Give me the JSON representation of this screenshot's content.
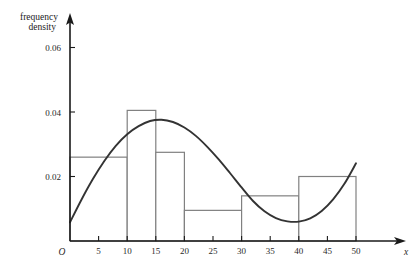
{
  "chart_data": {
    "type": "bar",
    "title": "",
    "subtitle": "",
    "ylabel_line1": "frequency",
    "ylabel_line2": "density",
    "xlabel": "x",
    "origin_label": "O",
    "grid": false,
    "legend": "none",
    "xlim": [
      0,
      52
    ],
    "ylim": [
      0,
      0.068
    ],
    "xticks": [
      5,
      10,
      15,
      20,
      25,
      30,
      35,
      40,
      45,
      50
    ],
    "xtick_labels": [
      "5",
      "10",
      "15",
      "20",
      "25",
      "30",
      "35",
      "40",
      "45",
      "50"
    ],
    "yticks": [
      0.02,
      0.04,
      0.06
    ],
    "ytick_labels": [
      "0.02",
      "0.04",
      "0.06"
    ],
    "bar_edges": [
      0,
      10,
      15,
      20,
      30,
      40,
      50
    ],
    "bars": [
      {
        "x_start": 0,
        "x_end": 10,
        "height": 0.026,
        "label": "0-10"
      },
      {
        "x_start": 10,
        "x_end": 15,
        "height": 0.0405,
        "label": "10-15"
      },
      {
        "x_start": 15,
        "x_end": 20,
        "height": 0.0275,
        "label": "15-20"
      },
      {
        "x_start": 20,
        "x_end": 30,
        "height": 0.0095,
        "label": "20-30"
      },
      {
        "x_start": 30,
        "x_end": 40,
        "height": 0.014,
        "label": "30-40"
      },
      {
        "x_start": 40,
        "x_end": 50,
        "height": 0.02,
        "label": "40-50"
      }
    ],
    "bar_color": "#ffffff",
    "bar_edge_color": "#808080",
    "curve": {
      "name": "frequency density curve",
      "color": "#333333",
      "x": [
        0,
        2,
        4,
        6,
        8,
        10,
        12,
        14,
        16,
        18,
        20,
        22,
        24,
        26,
        28,
        30,
        32,
        34,
        36,
        38,
        40,
        42,
        44,
        46,
        48,
        50
      ],
      "y": [
        0.0058,
        0.0128,
        0.0192,
        0.0248,
        0.0295,
        0.0331,
        0.0356,
        0.0372,
        0.0376,
        0.0369,
        0.0352,
        0.0326,
        0.0292,
        0.0253,
        0.021,
        0.0166,
        0.0124,
        0.0092,
        0.0071,
        0.0061,
        0.006,
        0.007,
        0.0093,
        0.0129,
        0.0178,
        0.0241
      ],
      "peak_x": 15,
      "peak_y": 0.0376,
      "min_x": 40,
      "min_y": 0.006,
      "end_x": 50,
      "end_y": 0.0241
    },
    "axis_color": "#1a1a1a"
  }
}
